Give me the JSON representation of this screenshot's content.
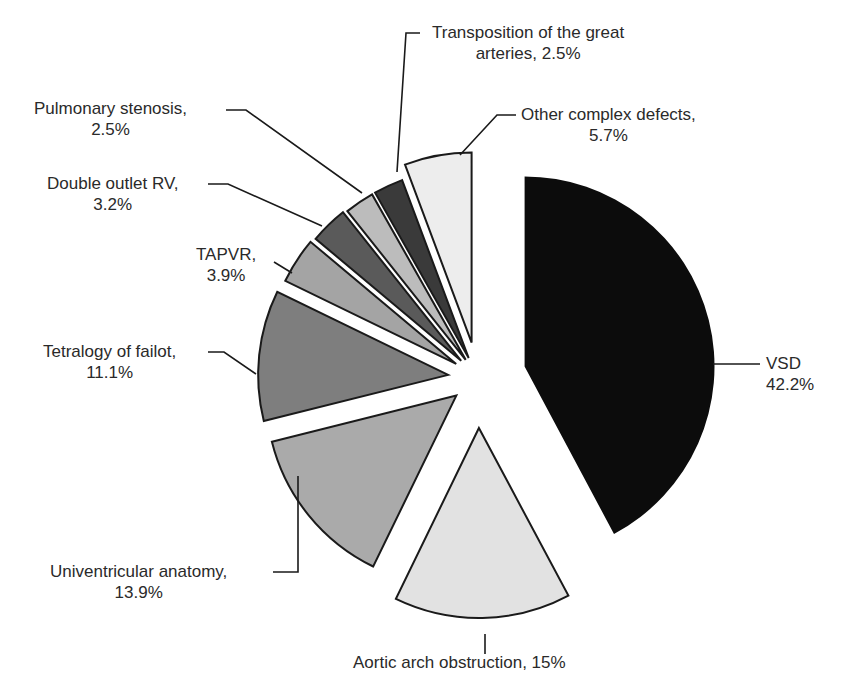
{
  "chart_data": {
    "type": "pie",
    "title": "",
    "exploded": true,
    "start_angle_deg": 0,
    "direction": "clockwise",
    "slices": [
      {
        "name": "VSD",
        "value": 42.2,
        "label_line1": "VSD",
        "label_line2": "42.2%",
        "color": "#0c0c0c"
      },
      {
        "name": "Aortic arch obstruction",
        "value": 15,
        "label_line1": "Aortic arch obstruction, 15%",
        "label_line2": "",
        "color": "#e2e2e2"
      },
      {
        "name": "Univentricular anatomy",
        "value": 13.9,
        "label_line1": "Univentricular anatomy,",
        "label_line2": "13.9%",
        "color": "#aaaaaa"
      },
      {
        "name": "Tetralogy of failot",
        "value": 11.1,
        "label_line1": "Tetralogy of failot,",
        "label_line2": "11.1%",
        "color": "#7e7e7e"
      },
      {
        "name": "TAPVR",
        "value": 3.9,
        "label_line1": "TAPVR,",
        "label_line2": "3.9%",
        "color": "#a4a4a4"
      },
      {
        "name": "Double outlet RV",
        "value": 3.2,
        "label_line1": "Double outlet RV,",
        "label_line2": "3.2%",
        "color": "#5a5a5a"
      },
      {
        "name": "Pulmonary stenosis",
        "value": 2.5,
        "label_line1": "Pulmonary stenosis,",
        "label_line2": "2.5%",
        "color": "#bcbcbc"
      },
      {
        "name": "Transposition of the great arteries",
        "value": 2.5,
        "label_line1": "Transposition of the great",
        "label_line2": "arteries, 2.5%",
        "color": "#3a3a3a"
      },
      {
        "name": "Other complex defects",
        "value": 5.7,
        "label_line1": "Other complex defects,",
        "label_line2": "5.7%",
        "color": "#ededed"
      }
    ],
    "legend": "none (direct labels with leader lines)"
  },
  "labels": {
    "vsd": {
      "l1": "VSD",
      "l2": "42.2%"
    },
    "aortic": {
      "l1": "Aortic arch obstruction, 15%"
    },
    "univentricular": {
      "l1": "Univentricular anatomy,",
      "l2": "13.9%"
    },
    "tetralogy": {
      "l1": "Tetralogy of failot,",
      "l2": "11.1%"
    },
    "tapvr": {
      "l1": "TAPVR,",
      "l2": "3.9%"
    },
    "dorv": {
      "l1": "Double outlet RV,",
      "l2": "3.2%"
    },
    "pulmonary": {
      "l1": "Pulmonary stenosis,",
      "l2": "2.5%"
    },
    "tga": {
      "l1": "Transposition of the great",
      "l2": "arteries, 2.5%"
    },
    "other": {
      "l1": "Other complex defects,",
      "l2": "5.7%"
    }
  }
}
